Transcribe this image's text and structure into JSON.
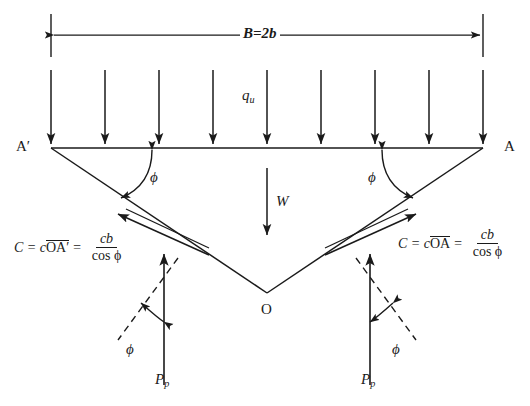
{
  "figure": {
    "type": "geotechnical-bearing-capacity-wedge-diagram"
  },
  "dimension": {
    "label": "B=2b",
    "name": "footing-width"
  },
  "loads": {
    "surcharge_label": "q",
    "surcharge_subscript": "u",
    "arrow_count": 9
  },
  "points": {
    "left": "A′",
    "right": "A",
    "apex": "O"
  },
  "weight": {
    "label": "W"
  },
  "angles": {
    "phi": "ϕ",
    "top_left": "ϕ",
    "top_right": "ϕ",
    "bottom_left": "ϕ",
    "bottom_right": "ϕ"
  },
  "passive": {
    "label": "P",
    "subscript": "p",
    "left_label": "P",
    "right_label": "P"
  },
  "cohesion": {
    "left": {
      "lhs": "C = c",
      "segment": "OA′",
      "eq": "=",
      "numerator": "cb",
      "denominator": "cos ϕ"
    },
    "right": {
      "lhs": "C = c",
      "segment": "OA",
      "eq": "=",
      "numerator": "cb",
      "denominator": "cos ϕ"
    }
  },
  "colors": {
    "ink": "#1a1a1a",
    "line": "#222222",
    "background": "#ffffff"
  }
}
